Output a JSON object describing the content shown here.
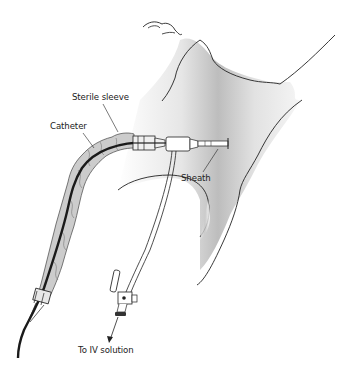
{
  "diagram": {
    "labels": {
      "sterile_sleeve": "Sterile sleeve",
      "catheter": "Catheter",
      "sheath": "Sheath",
      "iv_solution": "To IV solution"
    },
    "colors": {
      "line": "#222222",
      "skin_shade": "#bdbdbd",
      "sleeve_fill": "#c8c8c8",
      "background": "#ffffff"
    }
  }
}
